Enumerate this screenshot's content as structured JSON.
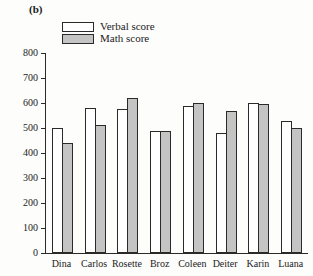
{
  "figure": {
    "panel_label": "(b)",
    "colors": {
      "verbal_fill": "#ffffff",
      "math_fill": "#c4c4c4",
      "outline": "#2a2a2a",
      "background": "#fdfdfb"
    }
  },
  "chart_data": {
    "type": "bar",
    "title": "(b)",
    "xlabel": "",
    "ylabel": "",
    "ylim": [
      0,
      800
    ],
    "yticks": [
      0,
      100,
      200,
      300,
      400,
      500,
      600,
      700,
      800
    ],
    "ytick_labels": [
      "0",
      "100",
      "200",
      "300",
      "400",
      "500",
      "600",
      "700",
      "800"
    ],
    "grid": false,
    "legend_position": "top-left",
    "categories": [
      "Dina",
      "Carlos",
      "Rosette",
      "Broz",
      "Coleen",
      "Deiter",
      "Karin",
      "Luana"
    ],
    "series": [
      {
        "name": "Verbal score",
        "fill": "#ffffff",
        "values": [
          500,
          580,
          575,
          490,
          590,
          480,
          600,
          530
        ]
      },
      {
        "name": "Math score",
        "fill": "#c4c4c4",
        "values": [
          440,
          512,
          620,
          488,
          600,
          568,
          598,
          500
        ]
      }
    ]
  }
}
